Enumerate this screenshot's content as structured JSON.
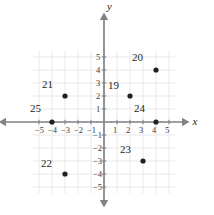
{
  "chart_data": {
    "type": "scatter",
    "title": "",
    "xlabel": "x",
    "ylabel": "y",
    "xlim": [
      -5.8,
      5.8
    ],
    "ylim": [
      -5.8,
      5.8
    ],
    "grid": true,
    "legend": "none",
    "x_ticks": [
      -5,
      -4,
      -3,
      -2,
      -1,
      1,
      2,
      3,
      4,
      5
    ],
    "y_ticks": [
      5,
      4,
      3,
      2,
      1,
      -1,
      -2,
      -3,
      -4,
      -5
    ],
    "x_tick_labels": [
      "−5",
      "−4",
      "−3",
      "−2",
      "−1",
      "1",
      "2",
      "3",
      "4",
      "5"
    ],
    "y_tick_labels": [
      "5",
      "4",
      "3",
      "2",
      "1",
      "−1",
      "−2",
      "−3",
      "−4",
      "−5"
    ],
    "points": [
      {
        "label": "19",
        "x": 2,
        "y": 2,
        "label_dx": -22,
        "label_dy": -16
      },
      {
        "label": "20",
        "x": 4,
        "y": 4,
        "label_dx": -24,
        "label_dy": -18
      },
      {
        "label": "21",
        "x": -3,
        "y": 2,
        "label_dx": -23,
        "label_dy": -17
      },
      {
        "label": "22",
        "x": -3,
        "y": -4,
        "label_dx": -24,
        "label_dy": -16
      },
      {
        "label": "23",
        "x": 3,
        "y": -3,
        "label_dx": -23,
        "label_dy": -17
      },
      {
        "label": "24",
        "x": 4,
        "y": 0,
        "label_dx": -22,
        "label_dy": -19
      },
      {
        "label": "25",
        "x": -4,
        "y": 0,
        "label_dx": -22,
        "label_dy": -19
      }
    ],
    "colors": {
      "point": "#231f20",
      "axis": "#808285",
      "grid": "#e8e8ea",
      "text": "#231f20",
      "background": "#ffffff"
    }
  },
  "geometry": {
    "origin_x": 104,
    "origin_y": 122,
    "unit_px": 13.0,
    "grid_min": -5.5,
    "grid_max": 5.5,
    "point_radius": 2.6
  }
}
